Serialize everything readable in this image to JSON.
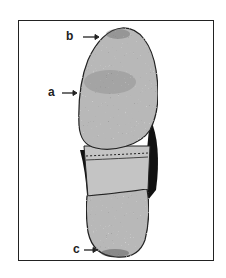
{
  "figure": {
    "labels": [
      {
        "id": "a",
        "text": "a",
        "target": "ball of forefoot (wear area)"
      },
      {
        "id": "b",
        "text": "b",
        "target": "toe tip (wear area)"
      },
      {
        "id": "c",
        "text": "c",
        "target": "heel back edge (wear area)"
      }
    ],
    "colors": {
      "sole_fill": "#b8b8b8",
      "shank_fill": "#c4c4c4",
      "dark_edge": "#111111",
      "outline": "#222222",
      "frame": "#222222"
    }
  }
}
